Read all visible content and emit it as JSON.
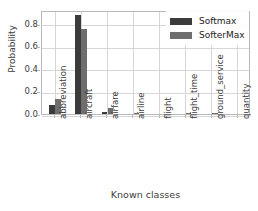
{
  "chart_data": {
    "type": "bar",
    "title": "",
    "xlabel": "Known classes",
    "ylabel": "Probability",
    "categories": [
      "abbreviation",
      "aircraft",
      "airfare",
      "airline",
      "flight",
      "flight_time",
      "ground_service",
      "quantity"
    ],
    "series": [
      {
        "name": "Softmax",
        "color": "#3b3b3b",
        "values": [
          0.08,
          0.88,
          0.02,
          0.0,
          0.0,
          0.0,
          0.0,
          0.0
        ]
      },
      {
        "name": "SofterMax",
        "color": "#6e6e6e",
        "values": [
          0.13,
          0.75,
          0.05,
          0.01,
          0.0,
          0.01,
          0.01,
          0.0
        ]
      }
    ],
    "ylim": [
      0.0,
      0.92
    ],
    "yticks": [
      0.0,
      0.2,
      0.4,
      0.6,
      0.8
    ],
    "ytick_labels": [
      "0.0",
      "0.2",
      "0.4",
      "0.6",
      "0.8"
    ],
    "grid": true,
    "legend_position": "upper right",
    "legend_entries": [
      "Softmax",
      "SofterMax"
    ]
  },
  "axes": {
    "y_title": "Probability",
    "x_title": "Known classes"
  },
  "legend": {
    "items": [
      {
        "label": "Softmax"
      },
      {
        "label": "SofterMax"
      }
    ]
  }
}
